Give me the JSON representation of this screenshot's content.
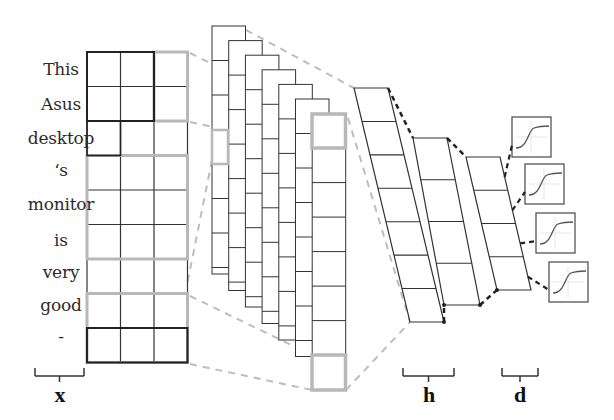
{
  "diagram": {
    "type": "cnn-text-classification",
    "words": [
      "This",
      "Asus",
      "desktop",
      "‘s",
      "monitor",
      "is",
      "very",
      "good",
      "-"
    ],
    "labels": {
      "input": "x",
      "hidden": "h",
      "dense": "d"
    },
    "colors": {
      "grid_line": "#333333",
      "highlight": "#b8b8b8",
      "dashed_gray": "#bdbdbd",
      "dashed_dark": "#222222",
      "text": "#2b2b2b"
    },
    "input_matrix": {
      "x": 87,
      "y": 52,
      "cols": 3,
      "rows": 9,
      "cell_w": 33.5,
      "cell_h": 34.5
    },
    "feature_maps": {
      "count": 7,
      "x0": 212,
      "y0": 26,
      "dx": 16.7,
      "dy": 14.6,
      "w": 33.5,
      "cell_h": 34.5
    },
    "hidden_layers": [
      {
        "tl": [
          354,
          88
        ],
        "tr": [
          388,
          88
        ],
        "bl": [
          410,
          322
        ],
        "br": [
          444,
          322
        ],
        "rows": 7
      },
      {
        "tl": [
          413,
          138
        ],
        "tr": [
          447,
          138
        ],
        "bl": [
          444,
          305
        ],
        "br": [
          480,
          305
        ],
        "rows": 4
      },
      {
        "tl": [
          466,
          157
        ],
        "tr": [
          500,
          157
        ],
        "bl": [
          497,
          290
        ],
        "br": [
          531,
          290
        ],
        "rows": 4
      }
    ],
    "sigmoids": [
      {
        "x": 512,
        "y": 117
      },
      {
        "x": 525,
        "y": 164
      },
      {
        "x": 536,
        "y": 213
      },
      {
        "x": 549,
        "y": 262
      }
    ],
    "brackets": [
      {
        "name": "x",
        "x1": 35,
        "x2": 84
      },
      {
        "name": "h",
        "x1": 403,
        "x2": 454
      },
      {
        "name": "d",
        "x1": 502,
        "x2": 538
      }
    ]
  }
}
